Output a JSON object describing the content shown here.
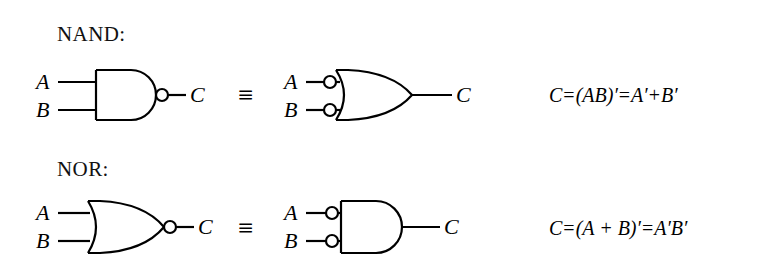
{
  "figure": {
    "background_color": "#ffffff",
    "stroke_color": "#000000",
    "equivalence_symbol": "≡"
  },
  "rows": [
    {
      "id": "nand",
      "heading": "NAND:",
      "left_circuit": {
        "gate_type": "and-gate",
        "output_bubble": true,
        "input_bubbles": false,
        "inputs": [
          "A",
          "B"
        ],
        "output": "C"
      },
      "right_circuit": {
        "gate_type": "or-gate",
        "output_bubble": false,
        "input_bubbles": true,
        "inputs": [
          "A",
          "B"
        ],
        "output": "C"
      },
      "equation": {
        "lhs": "C",
        "eq1": "=",
        "mid": "(AB)′",
        "eq2": "=",
        "rhs_left": "A′",
        "plus": "+",
        "rhs_right": "B′",
        "full": "C = (AB)′ = A′ + B′"
      }
    },
    {
      "id": "nor",
      "heading": "NOR:",
      "left_circuit": {
        "gate_type": "or-gate",
        "output_bubble": true,
        "input_bubbles": false,
        "inputs": [
          "A",
          "B"
        ],
        "output": "C"
      },
      "right_circuit": {
        "gate_type": "and-gate",
        "output_bubble": false,
        "input_bubbles": true,
        "inputs": [
          "A",
          "B"
        ],
        "output": "C"
      },
      "equation": {
        "lhs": "C",
        "eq1": "=",
        "mid": "(A + B)′",
        "eq2": "=",
        "rhs_left": "A′",
        "plus": "",
        "rhs_right": "B′",
        "full": "C = (A + B)′ = A′B′"
      }
    }
  ]
}
